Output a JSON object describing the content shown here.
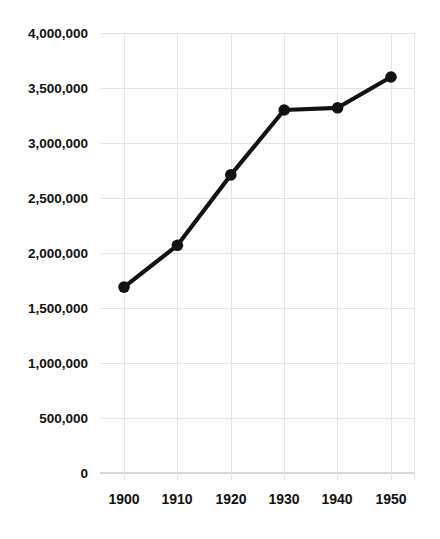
{
  "chart_data": {
    "type": "line",
    "title": "",
    "subtitle": "",
    "xlabel": "",
    "ylabel": "",
    "categories": [
      "1900",
      "1910",
      "1920",
      "1930",
      "1940",
      "1950"
    ],
    "x": [
      1900,
      1910,
      1920,
      1930,
      1940,
      1950
    ],
    "values": [
      1690000,
      2070000,
      2710000,
      3300000,
      3320000,
      3600000
    ],
    "series": [
      {
        "name": "",
        "values": [
          1690000,
          2070000,
          2710000,
          3300000,
          3320000,
          3600000
        ]
      }
    ],
    "xlim": [
      1900,
      1950
    ],
    "ylim": [
      0,
      4000000
    ],
    "ytick_values": [
      0,
      500000,
      1000000,
      1500000,
      2000000,
      2500000,
      3000000,
      3500000,
      4000000
    ],
    "ytick_labels": [
      "0",
      "500,000",
      "1,000,000",
      "1,500,000",
      "2,000,000",
      "2,500,000",
      "3,000,000",
      "3,500,000",
      "4,000,000"
    ],
    "xtick_labels": [
      "1900",
      "1910",
      "1920",
      "1930",
      "1940",
      "1950"
    ],
    "grid": {
      "horizontal": true,
      "vertical": true,
      "color": "#e4e4e4"
    },
    "legend": {
      "visible": false,
      "position": "none",
      "entries": []
    },
    "marker": {
      "shape": "circle",
      "color": "#121212",
      "size": 9
    },
    "line_color": "#121212",
    "line_width": 4.2,
    "background_color": "#ffffff",
    "annotations": []
  },
  "axes": {
    "y_labels": [
      "4,000,000",
      "3,500,000",
      "3,000,000",
      "2,500,000",
      "2,000,000",
      "1,500,000",
      "1,000,000",
      "500,000",
      "0"
    ],
    "x_labels": [
      "1900",
      "1910",
      "1920",
      "1930",
      "1940",
      "1950"
    ]
  }
}
